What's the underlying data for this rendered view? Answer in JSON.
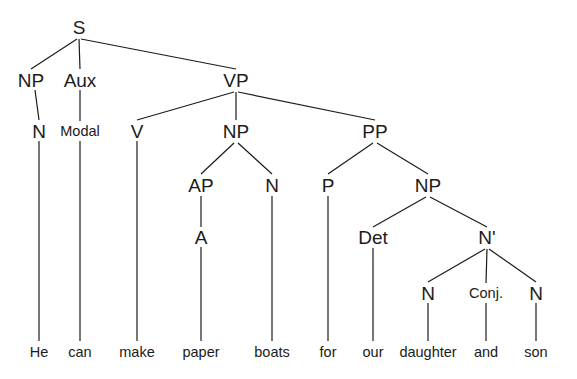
{
  "diagram": {
    "type": "syntax-tree",
    "sentence": "He can make paper boats for our daughter and son",
    "background_color": "#ffffff",
    "line_color": "#1b1b1b",
    "text_color": "#1b1b1b",
    "width": 577,
    "height": 379
  },
  "nodes": [
    {
      "id": "S",
      "label": "S",
      "x": 79,
      "y": 27,
      "size": "cat"
    },
    {
      "id": "NP1",
      "label": "NP",
      "x": 31,
      "y": 80,
      "size": "cat"
    },
    {
      "id": "Aux",
      "label": "Aux",
      "x": 80,
      "y": 80,
      "size": "cat"
    },
    {
      "id": "VP",
      "label": "VP",
      "x": 236,
      "y": 80,
      "size": "cat"
    },
    {
      "id": "N1",
      "label": "N",
      "x": 39,
      "y": 131,
      "size": "cat"
    },
    {
      "id": "Modal",
      "label": "Modal",
      "x": 80,
      "y": 131,
      "size": "cat-small"
    },
    {
      "id": "V",
      "label": "V",
      "x": 137,
      "y": 131,
      "size": "cat"
    },
    {
      "id": "NP2",
      "label": "NP",
      "x": 236,
      "y": 131,
      "size": "cat"
    },
    {
      "id": "PP",
      "label": "PP",
      "x": 375,
      "y": 131,
      "size": "cat"
    },
    {
      "id": "AP",
      "label": "AP",
      "x": 201,
      "y": 185,
      "size": "cat"
    },
    {
      "id": "N2",
      "label": "N",
      "x": 272,
      "y": 185,
      "size": "cat"
    },
    {
      "id": "P",
      "label": "P",
      "x": 328,
      "y": 185,
      "size": "cat"
    },
    {
      "id": "NP3",
      "label": "NP",
      "x": 428,
      "y": 185,
      "size": "cat"
    },
    {
      "id": "A",
      "label": "A",
      "x": 201,
      "y": 237,
      "size": "cat"
    },
    {
      "id": "Det",
      "label": "Det",
      "x": 373,
      "y": 237,
      "size": "cat"
    },
    {
      "id": "Nbar",
      "label": "N'",
      "x": 487,
      "y": 237,
      "size": "cat"
    },
    {
      "id": "N3",
      "label": "N",
      "x": 428,
      "y": 293,
      "size": "cat"
    },
    {
      "id": "Conj",
      "label": "Conj.",
      "x": 486,
      "y": 293,
      "size": "cat-small"
    },
    {
      "id": "N4",
      "label": "N",
      "x": 536,
      "y": 293,
      "size": "cat"
    },
    {
      "id": "w_he",
      "label": "He",
      "x": 39,
      "y": 352,
      "size": "leaf"
    },
    {
      "id": "w_can",
      "label": "can",
      "x": 80,
      "y": 352,
      "size": "leaf"
    },
    {
      "id": "w_make",
      "label": "make",
      "x": 137,
      "y": 352,
      "size": "leaf"
    },
    {
      "id": "w_paper",
      "label": "paper",
      "x": 201,
      "y": 352,
      "size": "leaf"
    },
    {
      "id": "w_boats",
      "label": "boats",
      "x": 272,
      "y": 352,
      "size": "leaf"
    },
    {
      "id": "w_for",
      "label": "for",
      "x": 328,
      "y": 352,
      "size": "leaf"
    },
    {
      "id": "w_our",
      "label": "our",
      "x": 373,
      "y": 352,
      "size": "leaf"
    },
    {
      "id": "w_daughter",
      "label": "daughter",
      "x": 428,
      "y": 352,
      "size": "leaf"
    },
    {
      "id": "w_and",
      "label": "and",
      "x": 486,
      "y": 352,
      "size": "leaf"
    },
    {
      "id": "w_son",
      "label": "son",
      "x": 536,
      "y": 352,
      "size": "leaf"
    }
  ],
  "edges": [
    {
      "from": "S",
      "to": "NP1",
      "x1": 77,
      "y1": 39,
      "x2": 31,
      "y2": 69
    },
    {
      "from": "S",
      "to": "Aux",
      "x1": 79,
      "y1": 39,
      "x2": 80,
      "y2": 69
    },
    {
      "from": "S",
      "to": "VP",
      "x1": 81,
      "y1": 39,
      "x2": 236,
      "y2": 69
    },
    {
      "from": "NP1",
      "to": "N1",
      "x1": 35,
      "y1": 90,
      "x2": 39,
      "y2": 120
    },
    {
      "from": "Aux",
      "to": "Modal",
      "x1": 80,
      "y1": 90,
      "x2": 80,
      "y2": 121
    },
    {
      "from": "VP",
      "to": "V",
      "x1": 234,
      "y1": 92,
      "x2": 137,
      "y2": 120
    },
    {
      "from": "VP",
      "to": "NP2",
      "x1": 236,
      "y1": 92,
      "x2": 236,
      "y2": 120
    },
    {
      "from": "VP",
      "to": "PP",
      "x1": 238,
      "y1": 92,
      "x2": 375,
      "y2": 120
    },
    {
      "from": "NP2",
      "to": "AP",
      "x1": 234,
      "y1": 143,
      "x2": 201,
      "y2": 174
    },
    {
      "from": "NP2",
      "to": "N2",
      "x1": 238,
      "y1": 143,
      "x2": 272,
      "y2": 174
    },
    {
      "from": "PP",
      "to": "P",
      "x1": 373,
      "y1": 143,
      "x2": 328,
      "y2": 174
    },
    {
      "from": "PP",
      "to": "NP3",
      "x1": 377,
      "y1": 143,
      "x2": 428,
      "y2": 174
    },
    {
      "from": "AP",
      "to": "A",
      "x1": 201,
      "y1": 196,
      "x2": 201,
      "y2": 227
    },
    {
      "from": "NP3",
      "to": "Det",
      "x1": 426,
      "y1": 197,
      "x2": 373,
      "y2": 227
    },
    {
      "from": "NP3",
      "to": "Nbar",
      "x1": 430,
      "y1": 197,
      "x2": 487,
      "y2": 227
    },
    {
      "from": "Nbar",
      "to": "N3",
      "x1": 485,
      "y1": 249,
      "x2": 428,
      "y2": 282
    },
    {
      "from": "Nbar",
      "to": "Conj",
      "x1": 487,
      "y1": 249,
      "x2": 486,
      "y2": 283
    },
    {
      "from": "Nbar",
      "to": "N4",
      "x1": 489,
      "y1": 249,
      "x2": 536,
      "y2": 282
    },
    {
      "from": "N1",
      "to": "w_he",
      "x1": 39,
      "y1": 141,
      "x2": 39,
      "y2": 341
    },
    {
      "from": "Modal",
      "to": "w_can",
      "x1": 80,
      "y1": 141,
      "x2": 80,
      "y2": 341
    },
    {
      "from": "V",
      "to": "w_make",
      "x1": 137,
      "y1": 141,
      "x2": 137,
      "y2": 341
    },
    {
      "from": "A",
      "to": "w_paper",
      "x1": 201,
      "y1": 247,
      "x2": 201,
      "y2": 341
    },
    {
      "from": "N2",
      "to": "w_boats",
      "x1": 272,
      "y1": 196,
      "x2": 272,
      "y2": 341
    },
    {
      "from": "P",
      "to": "w_for",
      "x1": 328,
      "y1": 196,
      "x2": 328,
      "y2": 341
    },
    {
      "from": "Det",
      "to": "w_our",
      "x1": 373,
      "y1": 248,
      "x2": 373,
      "y2": 341
    },
    {
      "from": "N3",
      "to": "w_daughter",
      "x1": 428,
      "y1": 303,
      "x2": 428,
      "y2": 341
    },
    {
      "from": "Conj",
      "to": "w_and",
      "x1": 486,
      "y1": 303,
      "x2": 486,
      "y2": 341
    },
    {
      "from": "N4",
      "to": "w_son",
      "x1": 536,
      "y1": 303,
      "x2": 536,
      "y2": 341
    }
  ]
}
